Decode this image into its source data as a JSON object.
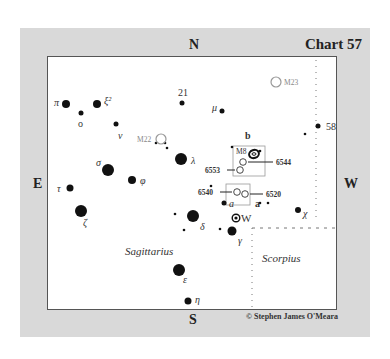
{
  "chart": {
    "title": "Chart 57",
    "copyright": "© Stephen James O'Meara",
    "directions": {
      "north": "N",
      "south": "S",
      "east": "E",
      "west": "W"
    },
    "constellations": [
      {
        "name": "Sagittarius",
        "x": 125,
        "y": 255
      },
      {
        "name": "Scorpius",
        "x": 262,
        "y": 262
      }
    ],
    "stars": [
      {
        "label": "π",
        "x": 66,
        "y": 104,
        "r": 4,
        "lx": 54,
        "ly": 106,
        "italic": true
      },
      {
        "label": "o",
        "x": 81,
        "y": 113,
        "r": 2.5,
        "lx": 78,
        "ly": 127,
        "italic": false
      },
      {
        "label": "ξ²",
        "x": 97,
        "y": 104,
        "r": 4,
        "lx": 104,
        "ly": 104,
        "italic": true
      },
      {
        "label": "ν",
        "x": 116,
        "y": 124,
        "r": 2.5,
        "lx": 118,
        "ly": 139,
        "italic": true
      },
      {
        "label": "21",
        "x": 182,
        "y": 103,
        "r": 2.5,
        "lx": 178,
        "ly": 96,
        "italic": false
      },
      {
        "label": "μ",
        "x": 222,
        "y": 111,
        "r": 2.5,
        "lx": 212,
        "ly": 111,
        "italic": true
      },
      {
        "label": "58",
        "x": 318,
        "y": 126,
        "r": 2.5,
        "lx": 326,
        "ly": 130,
        "italic": false
      },
      {
        "label": "λ",
        "x": 181,
        "y": 159,
        "r": 6,
        "lx": 191,
        "ly": 164,
        "italic": true
      },
      {
        "label": "σ",
        "x": 108,
        "y": 170,
        "r": 6,
        "lx": 96,
        "ly": 166,
        "italic": true
      },
      {
        "label": "φ",
        "x": 132,
        "y": 180,
        "r": 4,
        "lx": 140,
        "ly": 184,
        "italic": true
      },
      {
        "label": "τ",
        "x": 70,
        "y": 188,
        "r": 3.5,
        "lx": 57,
        "ly": 192,
        "italic": true
      },
      {
        "label": "ζ",
        "x": 81,
        "y": 211,
        "r": 6,
        "lx": 83,
        "ly": 226,
        "italic": true
      },
      {
        "label": "δ",
        "x": 193,
        "y": 216,
        "r": 6,
        "lx": 200,
        "ly": 230,
        "italic": true
      },
      {
        "label": "γ",
        "x": 232,
        "y": 231,
        "r": 4.5,
        "lx": 238,
        "ly": 244,
        "italic": true
      },
      {
        "label": "ε",
        "x": 179,
        "y": 270,
        "r": 6,
        "lx": 183,
        "ly": 283,
        "italic": true
      },
      {
        "label": "η",
        "x": 188,
        "y": 301,
        "r": 3.5,
        "lx": 195,
        "ly": 303,
        "italic": true
      },
      {
        "label": "χ",
        "x": 298,
        "y": 210,
        "r": 3,
        "lx": 303,
        "ly": 217,
        "italic": true
      },
      {
        "label": "a",
        "x": 224,
        "y": 203,
        "r": 2.5,
        "lx": 229,
        "ly": 207,
        "italic": true
      }
    ],
    "faint_stars": [
      {
        "x": 305,
        "y": 134
      },
      {
        "x": 156,
        "y": 143
      },
      {
        "x": 165,
        "y": 143
      },
      {
        "x": 167,
        "y": 148
      },
      {
        "x": 232,
        "y": 147
      },
      {
        "x": 260,
        "y": 151
      },
      {
        "x": 211,
        "y": 186
      },
      {
        "x": 260,
        "y": 203
      },
      {
        "x": 268,
        "y": 203
      },
      {
        "x": 175,
        "y": 214
      },
      {
        "x": 184,
        "y": 230
      },
      {
        "x": 220,
        "y": 229
      }
    ],
    "letter_marks": [
      {
        "text": "b",
        "x": 245,
        "y": 139
      },
      {
        "text": "a",
        "x": 255,
        "y": 207
      }
    ],
    "clusters": [
      {
        "label": "M22",
        "x": 161,
        "y": 139,
        "r": 5,
        "lx": 137,
        "ly": 142,
        "gray": true
      },
      {
        "label": "M23",
        "x": 276,
        "y": 82,
        "r": 5,
        "lx": 284,
        "ly": 85,
        "gray": true
      },
      {
        "label": "M8",
        "x": 0,
        "y": 0,
        "r": 0,
        "lx": 236,
        "ly": 154,
        "gray": false
      }
    ],
    "ngc": [
      {
        "label": "6544",
        "x": 243,
        "y": 162,
        "lx": 276,
        "ly": 165,
        "side": "right"
      },
      {
        "label": "6553",
        "x": 240,
        "y": 170,
        "lx": 205,
        "ly": 173,
        "side": "left"
      },
      {
        "label": "6540",
        "x": 237,
        "y": 192,
        "lx": 198,
        "ly": 195,
        "side": "left"
      },
      {
        "label": "6520",
        "x": 245,
        "y": 194,
        "lx": 266,
        "ly": 197,
        "side": "right"
      }
    ],
    "variable_star": {
      "label": "W",
      "x": 236,
      "y": 218
    }
  }
}
